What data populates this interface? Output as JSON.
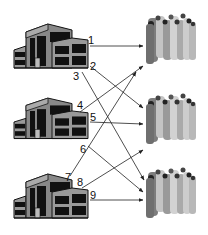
{
  "diagram": {
    "type": "network-flow",
    "sources": [
      {
        "id": "building-1",
        "icon": "building-icon"
      },
      {
        "id": "building-2",
        "icon": "building-icon"
      },
      {
        "id": "building-3",
        "icon": "building-icon"
      }
    ],
    "destinations": [
      {
        "id": "crowd-1",
        "icon": "crowd-icon"
      },
      {
        "id": "crowd-2",
        "icon": "crowd-icon"
      },
      {
        "id": "crowd-3",
        "icon": "crowd-icon"
      }
    ],
    "edges": [
      {
        "label": "1",
        "from": "building-1",
        "to": "crowd-1"
      },
      {
        "label": "2",
        "from": "building-1",
        "to": "crowd-2"
      },
      {
        "label": "3",
        "from": "building-1",
        "to": "crowd-3"
      },
      {
        "label": "4",
        "from": "building-2",
        "to": "crowd-1"
      },
      {
        "label": "5",
        "from": "building-2",
        "to": "crowd-2"
      },
      {
        "label": "6",
        "from": "building-2",
        "to": "crowd-3"
      },
      {
        "label": "7",
        "from": "building-3",
        "to": "crowd-1"
      },
      {
        "label": "8",
        "from": "building-3",
        "to": "crowd-2"
      },
      {
        "label": "9",
        "from": "building-3",
        "to": "crowd-3"
      }
    ]
  },
  "labels": {
    "e1": "1",
    "e2": "2",
    "e3": "3",
    "e4": "4",
    "e5": "5",
    "e6": "6",
    "e7": "7",
    "e8": "8",
    "e9": "9"
  }
}
